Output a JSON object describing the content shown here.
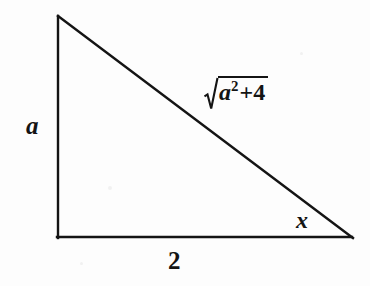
{
  "figure": {
    "type": "right-triangle-diagram",
    "background_color": "#fdfdfd",
    "line_color": "#141414",
    "text_color": "#141414"
  },
  "geometry": {
    "apex": {
      "x": 57,
      "y": 15
    },
    "bottom_left": {
      "x": 57,
      "y": 238
    },
    "bottom_right": {
      "x": 352,
      "y": 238
    },
    "right_angle_vertex": "bottom_left"
  },
  "labels": {
    "vertical_leg": "a",
    "base": "2",
    "angle": "x",
    "hypotenuse": {
      "radicand_variable": "a",
      "exponent": "2",
      "operator": "+",
      "constant": "4",
      "full_text": "√(a²+4)"
    }
  }
}
